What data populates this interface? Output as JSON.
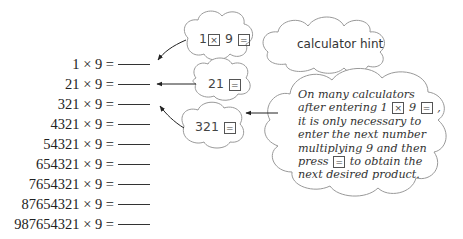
{
  "equations": [
    {
      "lhs": "1 × 9 =",
      "answer": ""
    },
    {
      "lhs": "21 × 9 =",
      "answer": ""
    },
    {
      "lhs": "321 × 9 =",
      "answer": ""
    },
    {
      "lhs": "4321 × 9 =",
      "answer": ""
    },
    {
      "lhs": "54321 × 9 =",
      "answer": ""
    },
    {
      "lhs": "654321 × 9 =",
      "answer": ""
    },
    {
      "lhs": "7654321 × 9 =",
      "answer": ""
    },
    {
      "lhs": "87654321 × 9 =",
      "answer": ""
    },
    {
      "lhs": "987654321 × 9 =",
      "answer": ""
    }
  ],
  "clouds": {
    "first": {
      "number": "1",
      "op_key": "×",
      "operand": "9",
      "equals_key": "="
    },
    "second": {
      "number": "21",
      "equals_key": "="
    },
    "third": {
      "number": "321",
      "equals_key": "="
    }
  },
  "hint": {
    "title": "calculator hint",
    "lines": {
      "l1": "On many calculators",
      "l2_pre": "after entering 1",
      "l2_key1": "×",
      "l2_mid": "9",
      "l2_key2": "=",
      "l2_post": ",",
      "l3": "it is only necessary to",
      "l4": "enter the next number",
      "l5": "multiplying 9 and then",
      "l6_pre": "press",
      "l6_key": "=",
      "l6_post": "to obtain the",
      "l7": "next desired product."
    }
  },
  "colors": {
    "stroke": "#888888",
    "text": "#333333",
    "arrow": "#222222"
  }
}
